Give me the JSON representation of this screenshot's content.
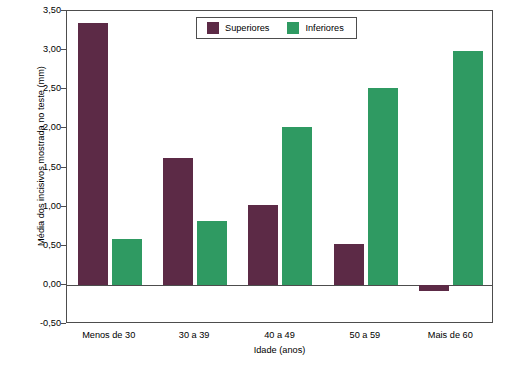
{
  "chart_data": {
    "type": "bar",
    "title": "",
    "xlabel": "Idade (anos)",
    "ylabel": "Média dos incisivos mostrada no teste (mm)",
    "categories": [
      "Menos de 30",
      "30 a 39",
      "40 a 49",
      "50 a 59",
      "Mais de 60"
    ],
    "series": [
      {
        "name": "Superiores",
        "color": "#5c2a46",
        "values": [
          3.35,
          1.62,
          1.02,
          0.52,
          -0.08
        ]
      },
      {
        "name": "Inferiores",
        "color": "#2f9a62",
        "values": [
          0.58,
          0.82,
          2.02,
          2.51,
          2.99
        ]
      }
    ],
    "ylim": [
      -0.5,
      3.5
    ],
    "yticks": [
      "3,50",
      "3,00",
      "2,50",
      "2,00",
      "1,50",
      "1,00",
      "0,50",
      "0,00",
      "-0,50"
    ],
    "ytick_values": [
      3.5,
      3.0,
      2.5,
      2.0,
      1.5,
      1.0,
      0.5,
      0.0,
      -0.5
    ],
    "grid": false,
    "legend_position": "top-center"
  }
}
